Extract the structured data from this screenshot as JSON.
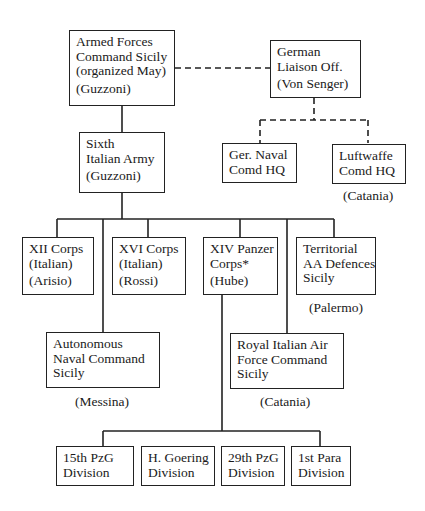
{
  "diagram": {
    "type": "organization-chart",
    "nodes": {
      "afcs": {
        "lines": [
          "Armed Forces",
          "Command Sicily",
          "(organized May)"
        ],
        "commander": "(Guzzoni)"
      },
      "liaison": {
        "lines": [
          "German",
          "Liaison Off."
        ],
        "commander": "(Von Senger)"
      },
      "army": {
        "lines": [
          "Sixth",
          "Italian Army"
        ],
        "commander": "(Guzzoni)"
      },
      "naval_hq": {
        "lines": [
          "Ger. Naval",
          "Comd HQ"
        ]
      },
      "luftwaffe": {
        "lines": [
          "Luftwaffe",
          "Comd HQ"
        ],
        "location": "(Catania)"
      },
      "xii": {
        "lines": [
          "XII Corps",
          "(Italian)"
        ],
        "commander": "(Arisio)"
      },
      "xvi": {
        "lines": [
          "XVI Corps",
          "(Italian)"
        ],
        "commander": "(Rossi)"
      },
      "xiv": {
        "lines": [
          "XIV Panzer",
          "Corps*"
        ],
        "commander": "(Hube)"
      },
      "aa": {
        "lines": [
          "Territorial",
          "AA Defences",
          "Sicily"
        ],
        "location": "(Palermo)"
      },
      "naval_cmd": {
        "lines": [
          "Autonomous",
          "Naval Command",
          "Sicily"
        ],
        "location": "(Messina)"
      },
      "air_force": {
        "lines": [
          "Royal Italian Air",
          "Force Command",
          "Sicily"
        ],
        "location": "(Catania)"
      },
      "d15": {
        "lines": [
          "15th PzG",
          "Division"
        ]
      },
      "dhg": {
        "lines": [
          "H. Goering",
          "Division"
        ]
      },
      "d29": {
        "lines": [
          "29th PzG",
          "Division"
        ]
      },
      "d1p": {
        "lines": [
          "1st Para",
          "Division"
        ]
      }
    },
    "edges": [
      {
        "from": "afcs",
        "to": "army",
        "style": "solid"
      },
      {
        "from": "afcs",
        "to": "liaison",
        "style": "dashed"
      },
      {
        "from": "liaison",
        "to": "naval_hq",
        "style": "dashed"
      },
      {
        "from": "liaison",
        "to": "luftwaffe",
        "style": "dashed"
      },
      {
        "from": "army",
        "to": "xii",
        "style": "solid"
      },
      {
        "from": "army",
        "to": "xvi",
        "style": "solid"
      },
      {
        "from": "army",
        "to": "xiv",
        "style": "solid"
      },
      {
        "from": "army",
        "to": "aa",
        "style": "solid"
      },
      {
        "from": "army",
        "to": "naval_cmd",
        "style": "solid"
      },
      {
        "from": "army",
        "to": "air_force",
        "style": "solid"
      },
      {
        "from": "xiv",
        "to": "d15",
        "style": "solid"
      },
      {
        "from": "xiv",
        "to": "dhg",
        "style": "solid"
      },
      {
        "from": "xiv",
        "to": "d29",
        "style": "solid"
      },
      {
        "from": "xiv",
        "to": "d1p",
        "style": "solid"
      }
    ]
  }
}
